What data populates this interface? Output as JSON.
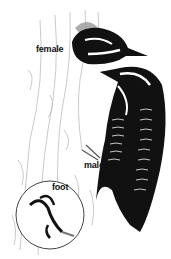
{
  "illustration": {
    "subject": "woodpecker pair on tree trunk",
    "labels": {
      "female": "female",
      "male": "male",
      "foot": "foot"
    },
    "colors": {
      "plumage": "#111111",
      "bark_lines": "#b8b8b8",
      "shadow": "#8a8a8a",
      "background": "#ffffff"
    }
  }
}
